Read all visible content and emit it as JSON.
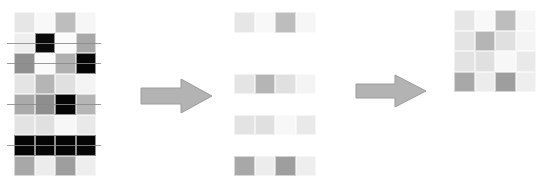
{
  "diagram": {
    "colors": {
      "arrow_fill": "#b3b3b3",
      "arrow_stroke": "#9c9c9c",
      "cut_line": "#8a8a8a"
    },
    "source_matrix": {
      "rows": 8,
      "cols": 4,
      "cells": [
        [
          "#e6e6e6",
          "#f8f8f8",
          "#bdbdbd",
          "#f6f6f6"
        ],
        [
          "#eeeeee",
          "#0a0a0a",
          "#fafafa",
          "#a8a8a8"
        ],
        [
          "#8f8f8f",
          "#fafafa",
          "#b0b0b0",
          "#050505"
        ],
        [
          "#e4e4e4",
          "#b5b5b5",
          "#e0e0e0",
          "#f4f4f4"
        ],
        [
          "#aaaaaa",
          "#8e8e8e",
          "#050505",
          "#b5b5b5"
        ],
        [
          "#e3e3e3",
          "#e0e0e0",
          "#f7f7f7",
          "#e9e9e9"
        ],
        [
          "#050505",
          "#050505",
          "#050505",
          "#050505"
        ],
        [
          "#a8a8a8",
          "#ececec",
          "#9e9e9e",
          "#eeeeee"
        ]
      ],
      "struck_rows": [
        2,
        3,
        5,
        7
      ]
    },
    "selected_rows": {
      "source_indices": [
        1,
        4,
        6,
        8
      ],
      "cells": [
        [
          "#e6e6e6",
          "#f8f8f8",
          "#bdbdbd",
          "#f6f6f6"
        ],
        [
          "#e4e4e4",
          "#b5b5b5",
          "#e0e0e0",
          "#f4f4f4"
        ],
        [
          "#e3e3e3",
          "#e0e0e0",
          "#f7f7f7",
          "#e9e9e9"
        ],
        [
          "#a8a8a8",
          "#ececec",
          "#9e9e9e",
          "#eeeeee"
        ]
      ]
    },
    "result_matrix": {
      "rows": 4,
      "cols": 4,
      "cells": [
        [
          "#e6e6e6",
          "#f8f8f8",
          "#bdbdbd",
          "#f6f6f6"
        ],
        [
          "#e4e4e4",
          "#b5b5b5",
          "#e0e0e0",
          "#f4f4f4"
        ],
        [
          "#e3e3e3",
          "#e0e0e0",
          "#f7f7f7",
          "#e9e9e9"
        ],
        [
          "#a8a8a8",
          "#ececec",
          "#9e9e9e",
          "#eeeeee"
        ]
      ]
    },
    "arrows": [
      {
        "name": "arrow-1",
        "direction": "right"
      },
      {
        "name": "arrow-2",
        "direction": "right"
      }
    ]
  }
}
